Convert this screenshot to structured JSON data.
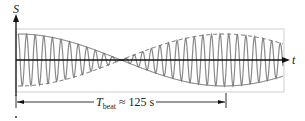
{
  "diagram": {
    "y_axis_label": "S",
    "x_axis_label": "t",
    "beat_period": {
      "symbol": "T",
      "subscript": "beat",
      "relation": "≈",
      "value": "125 s"
    },
    "colors": {
      "wave": "#8a8a8a",
      "envelope": "#6e6e6e",
      "axis": "#111111",
      "box": "#cfcfcf"
    }
  }
}
